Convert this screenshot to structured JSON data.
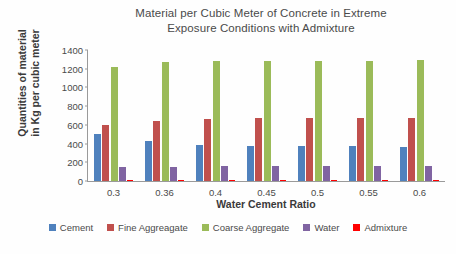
{
  "chart_data": {
    "type": "bar",
    "title": "Material per Cubic Meter of Concrete in Extreme Exposure Conditions with Admixture",
    "title_lines": [
      "Material per Cubic Meter of Concrete in Extreme",
      "Exposure Conditions with Admixture"
    ],
    "xlabel": "Water Cement Ratio",
    "ylabel": "Quantities of material in Kg per cubic meter",
    "ylabel_lines": [
      "Quantities of material",
      "in Kg per cubic meter"
    ],
    "categories": [
      "0.3",
      "0.36",
      "0.4",
      "0.45",
      "0.5",
      "0.55",
      "0.6"
    ],
    "ylim": [
      0,
      1400
    ],
    "ytick_step": 200,
    "yticks": [
      0,
      200,
      400,
      600,
      800,
      1000,
      1200,
      1400
    ],
    "grid": false,
    "legend_position": "bottom",
    "series": [
      {
        "name": "Cement",
        "color": "#4f81bd",
        "values": [
          500,
          430,
          390,
          375,
          375,
          375,
          360
        ]
      },
      {
        "name": "Fine Aggreagate",
        "color": "#c0504d",
        "values": [
          600,
          645,
          665,
          670,
          672,
          672,
          675
        ]
      },
      {
        "name": "Coarse Aggregate",
        "color": "#9bbb59",
        "values": [
          1220,
          1270,
          1280,
          1285,
          1285,
          1285,
          1290
        ]
      },
      {
        "name": "Water",
        "color": "#8064a2",
        "values": [
          150,
          155,
          158,
          160,
          162,
          162,
          165
        ]
      },
      {
        "name": "Admixture",
        "color": "#ff0000",
        "values": [
          10,
          11,
          12,
          13,
          13,
          14,
          15
        ]
      }
    ]
  },
  "legend": {
    "items": [
      {
        "label": "Cement",
        "color": "#4f81bd"
      },
      {
        "label": "Fine Aggreagate",
        "color": "#c0504d"
      },
      {
        "label": "Coarse Aggregate",
        "color": "#9bbb59"
      },
      {
        "label": "Water",
        "color": "#8064a2"
      },
      {
        "label": "Admixture",
        "color": "#ff0000"
      }
    ]
  }
}
